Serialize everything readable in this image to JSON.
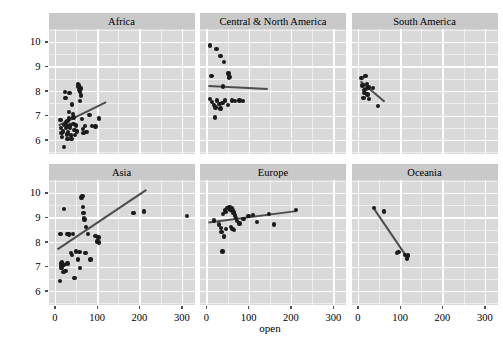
{
  "chart_data": {
    "type": "scatter",
    "title": "",
    "xlabel": "open",
    "ylabel": "logy",
    "xlim": [
      -15,
      330
    ],
    "ylim": [
      5.45,
      10.55
    ],
    "xticks": [
      0,
      100,
      200,
      300
    ],
    "yticks": [
      6,
      7,
      8,
      9,
      10
    ],
    "grid": true,
    "legend": "none",
    "facet_layout": {
      "rows": 2,
      "cols": 3
    },
    "colors": {
      "panel_background": "#d9d9d9",
      "strip_background": "#c9c9c9",
      "gridline": "#ffffff",
      "point": "#1a1a1a",
      "fit_line": "#4d4d4d",
      "text": "#000000",
      "plot_background": "#ffffff"
    },
    "panels": [
      {
        "label": "Africa",
        "fit_line": {
          "x0": 8,
          "y0": 6.62,
          "x1": 120,
          "y1": 7.57
        },
        "points": [
          {
            "x": 13,
            "y": 6.82
          },
          {
            "x": 15,
            "y": 6.48
          },
          {
            "x": 16,
            "y": 6.28
          },
          {
            "x": 17,
            "y": 6.12
          },
          {
            "x": 19,
            "y": 6.35
          },
          {
            "x": 21,
            "y": 6.62
          },
          {
            "x": 22,
            "y": 5.72
          },
          {
            "x": 24,
            "y": 7.95
          },
          {
            "x": 25,
            "y": 7.72
          },
          {
            "x": 27,
            "y": 6.72
          },
          {
            "x": 28,
            "y": 6.55
          },
          {
            "x": 29,
            "y": 6.22
          },
          {
            "x": 30,
            "y": 6.05
          },
          {
            "x": 31,
            "y": 6.3
          },
          {
            "x": 33,
            "y": 7.15
          },
          {
            "x": 34,
            "y": 6.88
          },
          {
            "x": 35,
            "y": 7.92
          },
          {
            "x": 36,
            "y": 6.48
          },
          {
            "x": 38,
            "y": 6.18
          },
          {
            "x": 39,
            "y": 6.05
          },
          {
            "x": 41,
            "y": 7.45
          },
          {
            "x": 43,
            "y": 7.05
          },
          {
            "x": 44,
            "y": 6.65
          },
          {
            "x": 46,
            "y": 6.42
          },
          {
            "x": 48,
            "y": 6.2
          },
          {
            "x": 50,
            "y": 6.6
          },
          {
            "x": 52,
            "y": 6.35
          },
          {
            "x": 55,
            "y": 8.28
          },
          {
            "x": 57,
            "y": 8.22
          },
          {
            "x": 58,
            "y": 8.05
          },
          {
            "x": 59,
            "y": 7.98
          },
          {
            "x": 60,
            "y": 7.6
          },
          {
            "x": 62,
            "y": 7.82
          },
          {
            "x": 64,
            "y": 6.85
          },
          {
            "x": 66,
            "y": 6.45
          },
          {
            "x": 68,
            "y": 6.28
          },
          {
            "x": 71,
            "y": 6.58
          },
          {
            "x": 75,
            "y": 6.32
          },
          {
            "x": 82,
            "y": 7.02
          },
          {
            "x": 88,
            "y": 6.58
          },
          {
            "x": 96,
            "y": 6.55
          },
          {
            "x": 104,
            "y": 6.88
          },
          {
            "x": 62,
            "y": 8.1
          },
          {
            "x": 56,
            "y": 8.18
          },
          {
            "x": 44,
            "y": 6.92
          },
          {
            "x": 36,
            "y": 6.6
          },
          {
            "x": 30,
            "y": 6.78
          },
          {
            "x": 26,
            "y": 6.48
          }
        ]
      },
      {
        "label": "Central & North America",
        "fit_line": {
          "x0": 5,
          "y0": 8.22,
          "x1": 145,
          "y1": 8.1
        },
        "points": [
          {
            "x": 8,
            "y": 9.85
          },
          {
            "x": 24,
            "y": 9.72
          },
          {
            "x": 33,
            "y": 9.42
          },
          {
            "x": 41,
            "y": 9.18
          },
          {
            "x": 12,
            "y": 8.62
          },
          {
            "x": 52,
            "y": 8.72
          },
          {
            "x": 55,
            "y": 8.58
          },
          {
            "x": 54,
            "y": 8.52
          },
          {
            "x": 40,
            "y": 8.18
          },
          {
            "x": 8,
            "y": 7.68
          },
          {
            "x": 14,
            "y": 7.55
          },
          {
            "x": 18,
            "y": 7.42
          },
          {
            "x": 22,
            "y": 7.32
          },
          {
            "x": 25,
            "y": 7.62
          },
          {
            "x": 31,
            "y": 7.48
          },
          {
            "x": 33,
            "y": 7.28
          },
          {
            "x": 44,
            "y": 7.62
          },
          {
            "x": 51,
            "y": 7.42
          },
          {
            "x": 60,
            "y": 7.62
          },
          {
            "x": 68,
            "y": 7.58
          },
          {
            "x": 78,
            "y": 7.62
          },
          {
            "x": 20,
            "y": 6.92
          },
          {
            "x": 86,
            "y": 7.6
          },
          {
            "x": 38,
            "y": 7.52
          }
        ]
      },
      {
        "label": "South America",
        "fit_line": {
          "x0": 5,
          "y0": 8.42,
          "x1": 62,
          "y1": 7.58
        },
        "points": [
          {
            "x": 9,
            "y": 8.52
          },
          {
            "x": 18,
            "y": 8.62
          },
          {
            "x": 11,
            "y": 8.22
          },
          {
            "x": 21,
            "y": 8.28
          },
          {
            "x": 25,
            "y": 8.15
          },
          {
            "x": 14,
            "y": 8.05
          },
          {
            "x": 19,
            "y": 8.08
          },
          {
            "x": 36,
            "y": 8.12
          },
          {
            "x": 16,
            "y": 7.92
          },
          {
            "x": 23,
            "y": 7.85
          },
          {
            "x": 13,
            "y": 7.72
          },
          {
            "x": 26,
            "y": 7.68
          },
          {
            "x": 48,
            "y": 7.38
          }
        ]
      },
      {
        "label": "Asia",
        "fit_line": {
          "x0": 5,
          "y0": 7.72,
          "x1": 215,
          "y1": 10.15
        },
        "points": [
          {
            "x": 12,
            "y": 6.42
          },
          {
            "x": 14,
            "y": 7.12
          },
          {
            "x": 15,
            "y": 7.02
          },
          {
            "x": 16,
            "y": 6.95
          },
          {
            "x": 17,
            "y": 7.18
          },
          {
            "x": 18,
            "y": 7.08
          },
          {
            "x": 20,
            "y": 6.78
          },
          {
            "x": 22,
            "y": 9.35
          },
          {
            "x": 13,
            "y": 8.32
          },
          {
            "x": 25,
            "y": 6.82
          },
          {
            "x": 28,
            "y": 8.32
          },
          {
            "x": 32,
            "y": 8.32
          },
          {
            "x": 34,
            "y": 8.3
          },
          {
            "x": 38,
            "y": 7.55
          },
          {
            "x": 40,
            "y": 7.48
          },
          {
            "x": 43,
            "y": 8.32
          },
          {
            "x": 46,
            "y": 6.52
          },
          {
            "x": 50,
            "y": 7.62
          },
          {
            "x": 55,
            "y": 7.28
          },
          {
            "x": 58,
            "y": 7.58
          },
          {
            "x": 60,
            "y": 6.95
          },
          {
            "x": 63,
            "y": 9.82
          },
          {
            "x": 65,
            "y": 9.88
          },
          {
            "x": 67,
            "y": 9.42
          },
          {
            "x": 68,
            "y": 9.18
          },
          {
            "x": 69,
            "y": 8.98
          },
          {
            "x": 70,
            "y": 8.92
          },
          {
            "x": 72,
            "y": 7.55
          },
          {
            "x": 74,
            "y": 8.62
          },
          {
            "x": 78,
            "y": 8.32
          },
          {
            "x": 84,
            "y": 7.28
          },
          {
            "x": 96,
            "y": 8.25
          },
          {
            "x": 103,
            "y": 8.18
          },
          {
            "x": 100,
            "y": 8.02
          },
          {
            "x": 104,
            "y": 7.98
          },
          {
            "x": 186,
            "y": 9.18
          },
          {
            "x": 210,
            "y": 9.25
          },
          {
            "x": 312,
            "y": 9.05
          },
          {
            "x": 20,
            "y": 7.05
          },
          {
            "x": 30,
            "y": 7.12
          }
        ]
      },
      {
        "label": "Europe",
        "fit_line": {
          "x0": 5,
          "y0": 8.82,
          "x1": 212,
          "y1": 9.28
        },
        "points": [
          {
            "x": 40,
            "y": 9.15
          },
          {
            "x": 44,
            "y": 9.28
          },
          {
            "x": 47,
            "y": 9.22
          },
          {
            "x": 50,
            "y": 9.38
          },
          {
            "x": 53,
            "y": 9.35
          },
          {
            "x": 55,
            "y": 9.42
          },
          {
            "x": 57,
            "y": 9.32
          },
          {
            "x": 60,
            "y": 9.38
          },
          {
            "x": 62,
            "y": 9.28
          },
          {
            "x": 64,
            "y": 9.18
          },
          {
            "x": 66,
            "y": 9.22
          },
          {
            "x": 68,
            "y": 9.08
          },
          {
            "x": 70,
            "y": 8.98
          },
          {
            "x": 72,
            "y": 8.85
          },
          {
            "x": 30,
            "y": 8.72
          },
          {
            "x": 34,
            "y": 8.58
          },
          {
            "x": 36,
            "y": 8.4
          },
          {
            "x": 41,
            "y": 8.22
          },
          {
            "x": 38,
            "y": 7.62
          },
          {
            "x": 58,
            "y": 8.62
          },
          {
            "x": 62,
            "y": 8.52
          },
          {
            "x": 66,
            "y": 8.48
          },
          {
            "x": 78,
            "y": 8.75
          },
          {
            "x": 88,
            "y": 8.95
          },
          {
            "x": 100,
            "y": 9.05
          },
          {
            "x": 110,
            "y": 9.1
          },
          {
            "x": 120,
            "y": 8.82
          },
          {
            "x": 148,
            "y": 9.15
          },
          {
            "x": 160,
            "y": 8.72
          },
          {
            "x": 212,
            "y": 9.3
          },
          {
            "x": 18,
            "y": 8.88
          },
          {
            "x": 46,
            "y": 8.52
          }
        ]
      },
      {
        "label": "Oceania",
        "fit_line": {
          "x0": 38,
          "y0": 9.35,
          "x1": 118,
          "y1": 7.32
        },
        "points": [
          {
            "x": 38,
            "y": 9.38
          },
          {
            "x": 62,
            "y": 9.25
          },
          {
            "x": 92,
            "y": 7.55
          },
          {
            "x": 96,
            "y": 7.58
          },
          {
            "x": 112,
            "y": 7.48
          },
          {
            "x": 118,
            "y": 7.45
          },
          {
            "x": 116,
            "y": 7.32
          }
        ]
      }
    ]
  },
  "geometry": {
    "panel_x": [
      48.5,
      200.0,
      351.5
    ],
    "panel_w": 146.0,
    "panel_y": [
      28.5,
      179.5
    ],
    "panel_h": 125.0,
    "strip_h": 16.0
  }
}
